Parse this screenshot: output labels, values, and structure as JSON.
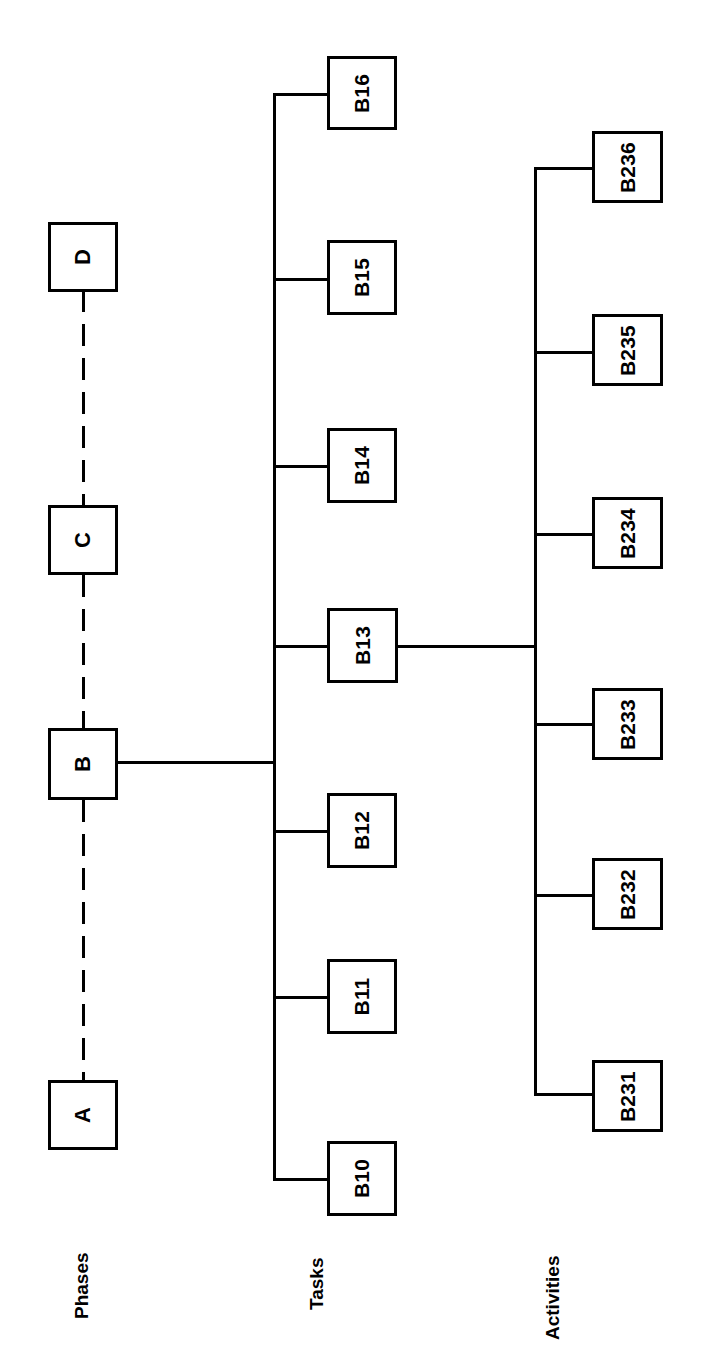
{
  "diagram": {
    "orientation": "rotated-90-ccw",
    "line_color": "#000000",
    "box_fill": "#ffffff",
    "rows": [
      {
        "id": "phases",
        "label": "Phases",
        "nodes": [
          {
            "id": "A",
            "label": "A"
          },
          {
            "id": "B",
            "label": "B"
          },
          {
            "id": "C",
            "label": "C"
          },
          {
            "id": "D",
            "label": "D"
          }
        ],
        "connector_style": "dashed"
      },
      {
        "id": "tasks",
        "label": "Tasks",
        "parent": "B",
        "nodes": [
          {
            "id": "B10",
            "label": "B10"
          },
          {
            "id": "B11",
            "label": "B11"
          },
          {
            "id": "B12",
            "label": "B12"
          },
          {
            "id": "B13",
            "label": "B13"
          },
          {
            "id": "B14",
            "label": "B14"
          },
          {
            "id": "B15",
            "label": "B15"
          },
          {
            "id": "B16",
            "label": "B16"
          }
        ],
        "connector_style": "solid"
      },
      {
        "id": "activities",
        "label": "Activities",
        "parent": "B13",
        "nodes": [
          {
            "id": "B231",
            "label": "B231"
          },
          {
            "id": "B232",
            "label": "B232"
          },
          {
            "id": "B233",
            "label": "B233"
          },
          {
            "id": "B234",
            "label": "B234"
          },
          {
            "id": "B235",
            "label": "B235"
          },
          {
            "id": "B236",
            "label": "B236"
          }
        ],
        "connector_style": "solid"
      }
    ]
  }
}
